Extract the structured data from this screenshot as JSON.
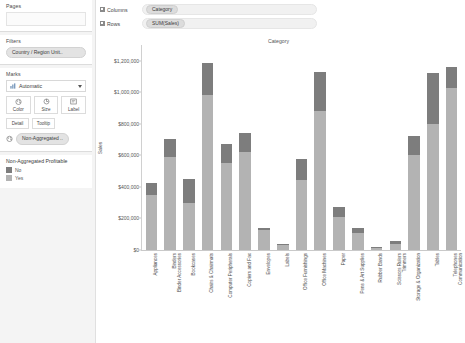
{
  "panel": {
    "pages": {
      "title": "Pages",
      "dropzone_value": ""
    },
    "filters": {
      "title": "Filters",
      "items": [
        {
          "label": "Country / Region Unit.."
        }
      ]
    },
    "marks": {
      "title": "Marks",
      "mark_type": "Automatic",
      "mark_type_icon": "bar-chart-icon",
      "caret_icon": "chevron-down-icon",
      "buttons": [
        {
          "label": "Color",
          "icon": "color-palette-icon"
        },
        {
          "label": "Size",
          "icon": "size-icon"
        },
        {
          "label": "Label",
          "icon": "label-icon"
        }
      ],
      "buttons_row2": [
        {
          "label": "Detail",
          "icon": "detail-icon"
        },
        {
          "label": "Tooltip",
          "icon": "tooltip-icon"
        }
      ],
      "encoding": {
        "icon": "color-palette-icon",
        "label": "Non-Aggregated .."
      }
    },
    "legend": {
      "title": "Non-Aggregated Profitable",
      "items": [
        {
          "label": "No",
          "color": "#7d7d7d"
        },
        {
          "label": "Yes",
          "color": "#b3b3b3"
        }
      ]
    }
  },
  "shelves": [
    {
      "name": "Columns",
      "icon": "grid-icon",
      "pill": "Category"
    },
    {
      "name": "Rows",
      "icon": "grid-icon",
      "pill": "SUM(Sales)"
    }
  ],
  "chart_data": {
    "type": "bar",
    "title": "Category",
    "xlabel": "",
    "ylabel": "Sales",
    "ylim": [
      0,
      1300000
    ],
    "grid": false,
    "stacked": true,
    "legend_position": "left-panel",
    "ytick_labels": [
      "$1,200,000",
      "$1,000,000",
      "$800,000",
      "$600,000",
      "$400,000",
      "$200,000",
      "$0"
    ],
    "ytick_values": [
      1200000,
      1000000,
      800000,
      600000,
      400000,
      200000,
      0
    ],
    "categories": [
      "Appliances",
      "Binders and Binder Accessories",
      "Bookcases",
      "Chairs & Chairmats",
      "Computer Peripherals",
      "Copiers and Fax",
      "Envelopes",
      "Labels",
      "Office Furnishings",
      "Office Machines",
      "Paper",
      "Pens & Art Supplies",
      "Rubber Bands",
      "Scissors, Rulers and Trimmers",
      "Storage & Organization",
      "Tables",
      "Telephones and Communication"
    ],
    "series": [
      {
        "name": "Yes",
        "color": "#b3b3b3",
        "values": [
          352000,
          592000,
          295000,
          985000,
          552000,
          622000,
          130000,
          32000,
          445000,
          880000,
          210000,
          105000,
          15000,
          40000,
          600000,
          800000,
          1030000
        ]
      },
      {
        "name": "No",
        "color": "#7d7d7d",
        "values": [
          76000,
          110000,
          155000,
          200000,
          118000,
          120000,
          10000,
          6000,
          135000,
          250000,
          60000,
          35000,
          4000,
          18000,
          120000,
          320000,
          130000
        ]
      }
    ],
    "totals": [
      428000,
      702000,
      450000,
      1185000,
      670000,
      742000,
      140000,
      38000,
      580000,
      1130000,
      270000,
      140000,
      19000,
      58000,
      720000,
      1120000,
      1160000
    ]
  }
}
